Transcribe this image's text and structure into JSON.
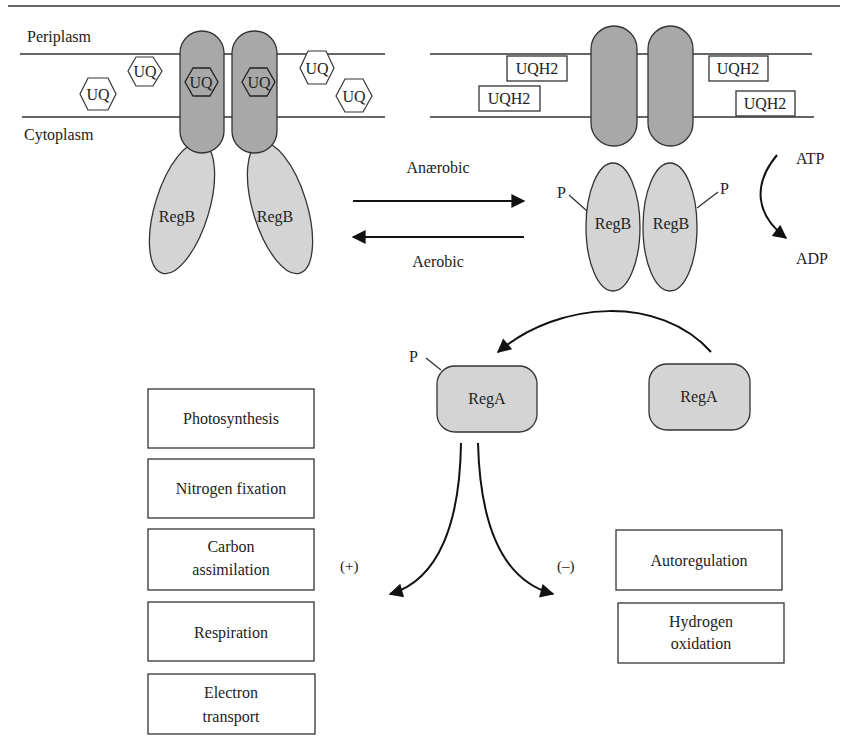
{
  "compartments": {
    "periplasm": "Periplasm",
    "cytoplasm": "Cytoplasm"
  },
  "left_state": {
    "bound_quinones": [
      "UQ",
      "UQ"
    ],
    "free_quinones": [
      "UQ",
      "UQ",
      "UQ",
      "UQ"
    ],
    "sensor_labels": [
      "RegB",
      "RegB"
    ]
  },
  "right_state": {
    "free_quinols": [
      "UQH2",
      "UQH2",
      "UQH2",
      "UQH2"
    ],
    "sensor_labels": [
      "RegB",
      "RegB"
    ],
    "phospho_labels": [
      "P",
      "P"
    ]
  },
  "transitions": {
    "forward": "Anærobic",
    "reverse": "Aerobic"
  },
  "atp_reaction": {
    "substrate": "ATP",
    "product": "ADP"
  },
  "response_regulator": {
    "phosphorylated": {
      "label": "RegA",
      "phospho": "P"
    },
    "unphosphorylated": {
      "label": "RegA"
    }
  },
  "regulation_signs": {
    "positive": "(+)",
    "negative": "(–)"
  },
  "activated_processes": [
    {
      "label_lines": [
        "Photosynthesis"
      ]
    },
    {
      "label_lines": [
        "Nitrogen fixation"
      ]
    },
    {
      "label_lines": [
        "Carbon",
        "assimilation"
      ]
    },
    {
      "label_lines": [
        "Respiration"
      ]
    },
    {
      "label_lines": [
        "Electron",
        "transport"
      ]
    }
  ],
  "repressed_processes": [
    {
      "label_lines": [
        "Autoregulation"
      ]
    },
    {
      "label_lines": [
        "Hydrogen",
        "oxidation"
      ]
    }
  ],
  "colors": {
    "transmembrane": "#a8a8a8",
    "cytoplasmic": "#d4d4d4",
    "ink": "#222222",
    "background": "#ffffff"
  }
}
